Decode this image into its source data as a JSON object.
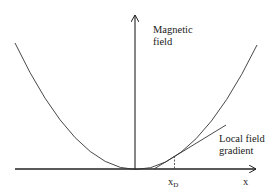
{
  "diagram": {
    "y_axis_label_line1": "Magnetic",
    "y_axis_label_line2": "field",
    "x_axis_label": "x",
    "marker_label_main": "x",
    "marker_label_sub": "D",
    "tangent_label_line1": "Local field",
    "tangent_label_line2": "gradient",
    "colors": {
      "stroke": "#222222",
      "text": "#1a1a1a",
      "background": "#ffffff"
    }
  }
}
